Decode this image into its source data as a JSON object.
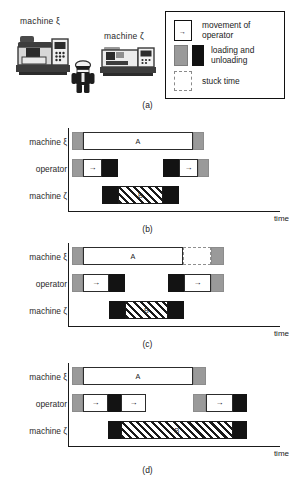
{
  "figure": {
    "panels": [
      {
        "id": "a",
        "caption": "(a)"
      },
      {
        "id": "b",
        "caption": "(b)"
      },
      {
        "id": "c",
        "caption": "(c)"
      },
      {
        "id": "d",
        "caption": "(d)"
      }
    ]
  },
  "scene": {
    "machine_xi_label": "machine ξ",
    "machine_zeta_label": "machine ζ",
    "operator_icon": "operator-figure-icon",
    "machine_xi_icon": "milling-machine-icon",
    "machine_zeta_icon": "lathe-machine-icon"
  },
  "legend": {
    "entries": [
      {
        "text": "movement of\noperator",
        "line1": "movement of",
        "line2": "operator",
        "swatch": "white-box-with-arrow"
      },
      {
        "text": "loading and\nunloading",
        "line1": "loading and",
        "line2": "unloading",
        "swatch": "gray-and-black-box"
      },
      {
        "text": "stuck time",
        "line1": "stuck time",
        "line2": "",
        "swatch": "dashed-box"
      }
    ],
    "arrow_glyph": "→"
  },
  "colors": {
    "gray": "#9a9a9a",
    "black": "#131313",
    "white": "#ffffff",
    "stuck_border": "#8f8f8f",
    "hatch": "#1a1a1a",
    "axis": "#1a1a1a"
  },
  "axis": {
    "time_label": "time"
  },
  "rows": {
    "machine_xi": "machine ξ",
    "operator": "operator",
    "machine_zeta": "machine ζ"
  },
  "chart_data": {
    "type": "bar",
    "xlabel": "time",
    "ylabel": "",
    "categories": [
      "machine ξ",
      "operator",
      "machine ζ"
    ],
    "legend": [
      "movement of operator",
      "loading and unloading",
      "stuck time"
    ],
    "panels": [
      {
        "id": "b",
        "caption": "(b)",
        "rows": [
          {
            "name": "machine ξ",
            "segments": [
              {
                "kind": "gray",
                "label": "",
                "start": 0,
                "width": 11
              },
              {
                "kind": "white",
                "label": "A",
                "start": 11,
                "width": 110
              },
              {
                "kind": "gray",
                "label": "",
                "start": 121,
                "width": 11
              }
            ]
          },
          {
            "name": "operator",
            "segments": [
              {
                "kind": "gray",
                "label": "",
                "start": 0,
                "width": 11
              },
              {
                "kind": "white",
                "label": "→",
                "start": 11,
                "width": 19
              },
              {
                "kind": "black",
                "label": "",
                "start": 30,
                "width": 16
              },
              {
                "kind": "black",
                "label": "",
                "start": 91,
                "width": 16
              },
              {
                "kind": "white",
                "label": "→",
                "start": 107,
                "width": 19
              },
              {
                "kind": "gray",
                "label": "",
                "start": 126,
                "width": 11
              }
            ]
          },
          {
            "name": "machine ζ",
            "segments": [
              {
                "kind": "black",
                "label": "",
                "start": 30,
                "width": 16
              },
              {
                "kind": "hatch",
                "label": "B",
                "start": 46,
                "width": 45
              },
              {
                "kind": "black",
                "label": "",
                "start": 91,
                "width": 16
              }
            ]
          }
        ]
      },
      {
        "id": "c",
        "caption": "(c)",
        "rows": [
          {
            "name": "machine ξ",
            "segments": [
              {
                "kind": "gray",
                "label": "",
                "start": 0,
                "width": 11
              },
              {
                "kind": "white",
                "label": "A",
                "start": 11,
                "width": 100
              },
              {
                "kind": "stuck",
                "label": "",
                "start": 111,
                "width": 28
              },
              {
                "kind": "gray",
                "label": "",
                "start": 139,
                "width": 13
              }
            ]
          },
          {
            "name": "operator",
            "segments": [
              {
                "kind": "gray",
                "label": "",
                "start": 0,
                "width": 11
              },
              {
                "kind": "white",
                "label": "→",
                "start": 11,
                "width": 26
              },
              {
                "kind": "black",
                "label": "",
                "start": 37,
                "width": 16
              },
              {
                "kind": "black",
                "label": "",
                "start": 96,
                "width": 16
              },
              {
                "kind": "white",
                "label": "→",
                "start": 112,
                "width": 27
              },
              {
                "kind": "gray",
                "label": "",
                "start": 139,
                "width": 13
              }
            ]
          },
          {
            "name": "machine ζ",
            "segments": [
              {
                "kind": "black",
                "label": "",
                "start": 37,
                "width": 16
              },
              {
                "kind": "hatch",
                "label": "B",
                "start": 53,
                "width": 43
              },
              {
                "kind": "black",
                "label": "",
                "start": 96,
                "width": 16
              }
            ]
          }
        ]
      },
      {
        "id": "d",
        "caption": "(d)",
        "rows": [
          {
            "name": "machine ξ",
            "segments": [
              {
                "kind": "gray",
                "label": "",
                "start": 0,
                "width": 11
              },
              {
                "kind": "white",
                "label": "A",
                "start": 11,
                "width": 110
              },
              {
                "kind": "gray",
                "label": "",
                "start": 121,
                "width": 13
              }
            ]
          },
          {
            "name": "operator",
            "segments": [
              {
                "kind": "gray",
                "label": "",
                "start": 0,
                "width": 11
              },
              {
                "kind": "white",
                "label": "→",
                "start": 11,
                "width": 25
              },
              {
                "kind": "black",
                "label": "",
                "start": 36,
                "width": 13
              },
              {
                "kind": "white",
                "label": "→",
                "start": 49,
                "width": 25
              },
              {
                "kind": "gray",
                "label": "",
                "start": 121,
                "width": 13
              },
              {
                "kind": "white",
                "label": "→",
                "start": 134,
                "width": 27
              },
              {
                "kind": "black",
                "label": "",
                "start": 161,
                "width": 14
              }
            ]
          },
          {
            "name": "machine ζ",
            "segments": [
              {
                "kind": "black",
                "label": "",
                "start": 36,
                "width": 13
              },
              {
                "kind": "hatch",
                "label": "B",
                "start": 49,
                "width": 112
              },
              {
                "kind": "black",
                "label": "",
                "start": 161,
                "width": 14
              }
            ]
          }
        ]
      }
    ]
  }
}
